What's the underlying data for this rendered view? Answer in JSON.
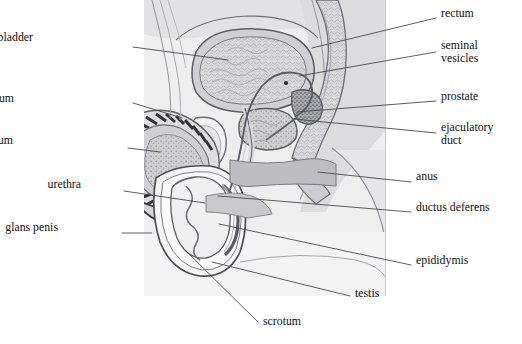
{
  "figure": {
    "background_color": "#ffffff",
    "leader_line_color": "#4a4a52",
    "text_color": "#111111",
    "palette": {
      "skin_light": "#e9e9ea",
      "tissue_mid": "#d3d3d6",
      "tissue_dark": "#b4b4b8",
      "muscle_gray": "#9a9a9f",
      "outline": "#55555c",
      "dark_hatch": "#3a3a40",
      "cavity_white": "#fbfbfc",
      "bone_speckle": "#a8a8ad"
    }
  },
  "labels": {
    "left": [
      {
        "id": "urinary-bladder",
        "text": "urinary bladder",
        "x": 33,
        "y": 41,
        "lines": 1
      },
      {
        "id": "corpus-cavernosum",
        "text": "corpus cavernosum",
        "x": 14,
        "y": 102,
        "lines": 1
      },
      {
        "id": "corpus-spongiosum",
        "text": "corpus spongiosum",
        "x": 13,
        "y": 144,
        "lines": 1
      },
      {
        "id": "urethra",
        "text": "urethra",
        "x": 81,
        "y": 188,
        "lines": 1
      },
      {
        "id": "glans-penis",
        "text": "glans penis",
        "x": 58,
        "y": 231,
        "lines": 1
      }
    ],
    "right": [
      {
        "id": "rectum",
        "text": "rectum",
        "x": 441,
        "y": 17,
        "lines": 1
      },
      {
        "id": "seminal-vesicles",
        "text": "seminal\nvesicles",
        "x": 441,
        "y": 49,
        "lines": 2
      },
      {
        "id": "prostate",
        "text": "prostate",
        "x": 441,
        "y": 100,
        "lines": 1
      },
      {
        "id": "ejaculatory-duct",
        "text": "ejaculatory\nduct",
        "x": 441,
        "y": 131,
        "lines": 2
      },
      {
        "id": "anus",
        "text": "anus",
        "x": 416,
        "y": 180,
        "lines": 1
      },
      {
        "id": "ductus-deferens",
        "text": "ductus deferens",
        "x": 416,
        "y": 211,
        "lines": 1
      },
      {
        "id": "epididymis",
        "text": "epididymis",
        "x": 416,
        "y": 264,
        "lines": 1
      }
    ],
    "bottom": [
      {
        "id": "testis",
        "text": "testis",
        "x": 355,
        "y": 297,
        "lines": 1
      },
      {
        "id": "scrotum",
        "text": "scrotum",
        "x": 263,
        "y": 325,
        "lines": 1
      }
    ]
  },
  "leaders": [
    {
      "id": "leader-urinary-bladder",
      "from": [
        133,
        47
      ],
      "to": [
        228,
        60
      ]
    },
    {
      "id": "leader-corpus-cavernosum",
      "from": [
        133,
        103
      ],
      "to": [
        182,
        118
      ]
    },
    {
      "id": "leader-corpus-spongiosum",
      "from": [
        128,
        148
      ],
      "to": [
        160,
        152
      ]
    },
    {
      "id": "leader-urethra",
      "from": [
        124,
        191
      ],
      "to": [
        205,
        203
      ]
    },
    {
      "id": "leader-glans-penis",
      "from": [
        122,
        233
      ],
      "to": [
        152,
        233
      ]
    },
    {
      "id": "leader-rectum",
      "from": [
        436,
        18
      ],
      "to": [
        312,
        48
      ]
    },
    {
      "id": "leader-seminal-vesicles",
      "from": [
        436,
        52
      ],
      "to": [
        299,
        76
      ]
    },
    {
      "id": "leader-prostate",
      "from": [
        436,
        101
      ],
      "to": [
        297,
        112
      ]
    },
    {
      "id": "leader-ejaculatory-duct",
      "from": [
        436,
        133
      ],
      "to": [
        294,
        119
      ]
    },
    {
      "id": "leader-anus",
      "from": [
        411,
        182
      ],
      "to": [
        318,
        172
      ]
    },
    {
      "id": "leader-ductus-deferens",
      "from": [
        411,
        212
      ],
      "to": [
        218,
        196
      ]
    },
    {
      "id": "leader-epididymis",
      "from": [
        411,
        265
      ],
      "to": [
        219,
        224
      ]
    },
    {
      "id": "leader-testis",
      "from": [
        350,
        296
      ],
      "to": [
        212,
        262
      ]
    },
    {
      "id": "leader-scrotum",
      "from": [
        258,
        322
      ],
      "to": [
        185,
        250
      ]
    }
  ]
}
